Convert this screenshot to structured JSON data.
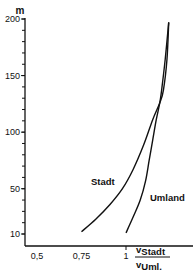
{
  "chart_data": {
    "type": "line",
    "title": "",
    "ylabel": "m",
    "xlabel_numerator": "v",
    "xlabel_numerator_sub": "Stadt",
    "xlabel_denominator": "v",
    "xlabel_denominator_sub": "Uml.",
    "xlim": [
      0.43,
      1.33
    ],
    "ylim": [
      0,
      200
    ],
    "x_ticks": [
      {
        "value": 0.5,
        "label": "0,5"
      },
      {
        "value": 0.75,
        "label": "0,75"
      },
      {
        "value": 1,
        "label": "1"
      }
    ],
    "y_ticks": [
      {
        "value": 10,
        "label": "10"
      },
      {
        "value": 50,
        "label": "50"
      },
      {
        "value": 100,
        "label": "100"
      },
      {
        "value": 150,
        "label": "150"
      },
      {
        "value": 200,
        "label": "200"
      }
    ],
    "y_minor_step": 10,
    "grid": false,
    "series": [
      {
        "name": "Stadt",
        "x": [
          0.75,
          0.83,
          0.91,
          0.98,
          1.04,
          1.1,
          1.15,
          1.19,
          1.21,
          1.23,
          1.24
        ],
        "y": [
          12,
          23,
          36,
          50,
          67,
          89,
          111,
          126,
          137,
          164,
          197
        ]
      },
      {
        "name": "Umland",
        "x": [
          1.0,
          1.04,
          1.08,
          1.11,
          1.13,
          1.15,
          1.17,
          1.19,
          1.2,
          1.22,
          1.24
        ],
        "y": [
          11,
          25,
          40,
          57,
          75,
          93,
          111,
          126,
          137,
          164,
          197
        ]
      }
    ]
  }
}
